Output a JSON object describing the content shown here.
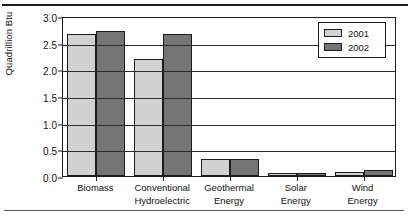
{
  "chart_data": {
    "type": "bar",
    "title": "",
    "xlabel": "",
    "ylabel": "Quadrillion Btu",
    "ylim": [
      0.0,
      3.0
    ],
    "ytick_labels": [
      "0.0",
      "0.5",
      "1.0",
      "1.5",
      "2.0",
      "2.5",
      "3.0"
    ],
    "ytick_values": [
      0.0,
      0.5,
      1.0,
      1.5,
      2.0,
      2.5,
      3.0
    ],
    "grid": true,
    "grid_axis": "y",
    "legend_position": "top-right",
    "categories": [
      "Biomass",
      "Conventional Hydroelectric",
      "Geothermal Energy",
      "Solar Energy",
      "Wind Energy"
    ],
    "category_lines": [
      [
        "Biomass"
      ],
      [
        "Conventional",
        "Hydroelectric"
      ],
      [
        "Geothermal",
        "Energy"
      ],
      [
        "Solar",
        "Energy"
      ],
      [
        "Wind",
        "Energy"
      ]
    ],
    "series": [
      {
        "name": "2001",
        "color": "#d2d2d2",
        "values": [
          2.66,
          2.2,
          0.31,
          0.06,
          0.07
        ]
      },
      {
        "name": "2002",
        "color": "#757575",
        "values": [
          2.72,
          2.66,
          0.31,
          0.06,
          0.11
        ]
      }
    ]
  },
  "legend": {
    "entries": [
      {
        "label": "2001"
      },
      {
        "label": "2002"
      }
    ]
  },
  "axis": {
    "y_title": "Quadrillion Btu"
  }
}
